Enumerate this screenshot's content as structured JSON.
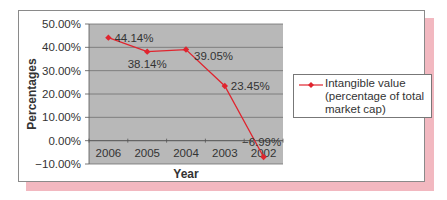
{
  "chart_data": {
    "type": "line",
    "title": "",
    "xlabel": "Year",
    "ylabel": "Percentages",
    "categories": [
      "2006",
      "2005",
      "2004",
      "2003",
      "2002"
    ],
    "series": [
      {
        "name": "Intangible value (percentage of total market cap)",
        "values": [
          44.14,
          38.14,
          39.05,
          23.45,
          -6.99
        ],
        "color": "#e0242e"
      }
    ],
    "data_labels": [
      "44.14%",
      "38.14%",
      "39.05%",
      "23.45%",
      "−6.99%"
    ],
    "yticks": [
      "50.00%",
      "40.00%",
      "30.00%",
      "20.00%",
      "10.00%",
      "0.00%",
      "−10.00%"
    ],
    "ylim": [
      -10,
      50
    ],
    "grid": true,
    "legend_position": "right"
  },
  "legend": {
    "label": "Intangible value (percentage of total market cap)"
  },
  "colors": {
    "plot_bg": "#b8b8b8",
    "line": "#e0242e",
    "shadow": "#f2b8c0"
  }
}
